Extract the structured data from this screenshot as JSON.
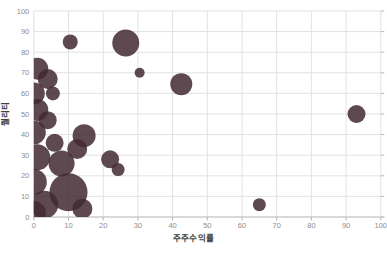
{
  "chart": {
    "x_axis": {
      "title": "주주수익률",
      "ticks": [
        0,
        10,
        20,
        30,
        40,
        50,
        60,
        70,
        80,
        90,
        100
      ],
      "range": [
        0,
        100
      ]
    },
    "y_axis": {
      "title": "퀄리티",
      "ticks": [
        0,
        10,
        20,
        30,
        40,
        50,
        60,
        70,
        80,
        90,
        100
      ],
      "range": [
        0,
        100
      ]
    },
    "colors": {
      "bubble": "rgba(66,41,49,0.85)",
      "grid": "#e2e2e2",
      "axis_line": "#c0c0c0",
      "tick_mark": "#b5b5b5",
      "tick_label": "#8e8e8e",
      "axis_title": "#3f3f3f",
      "background": "#ffffff"
    }
  },
  "chart_data": {
    "type": "scatter",
    "subtype": "bubble",
    "title": "",
    "xlabel": "주주수익률",
    "ylabel": "퀄리티",
    "xlim": [
      0,
      100
    ],
    "ylim": [
      0,
      100
    ],
    "grid": true,
    "legend": false,
    "points": [
      {
        "x": 1,
        "y": 72,
        "r": 11
      },
      {
        "x": 4,
        "y": 67,
        "r": 10
      },
      {
        "x": 0,
        "y": 60,
        "r": 11
      },
      {
        "x": 5.5,
        "y": 60,
        "r": 7
      },
      {
        "x": 1,
        "y": 52,
        "r": 11
      },
      {
        "x": 4,
        "y": 47,
        "r": 9
      },
      {
        "x": 0,
        "y": 41,
        "r": 12
      },
      {
        "x": 6,
        "y": 36,
        "r": 9
      },
      {
        "x": 1,
        "y": 29,
        "r": 13
      },
      {
        "x": 8,
        "y": 26,
        "r": 13
      },
      {
        "x": 0,
        "y": 17,
        "r": 13
      },
      {
        "x": 10,
        "y": 12,
        "r": 19
      },
      {
        "x": 3,
        "y": 6,
        "r": 14
      },
      {
        "x": 14,
        "y": 4,
        "r": 10
      },
      {
        "x": 0,
        "y": 2,
        "r": 12
      },
      {
        "x": 12.5,
        "y": 33,
        "r": 10
      },
      {
        "x": 14.5,
        "y": 39.5,
        "r": 11.5
      },
      {
        "x": 22,
        "y": 28,
        "r": 9
      },
      {
        "x": 24.3,
        "y": 23,
        "r": 6.5
      },
      {
        "x": 10.5,
        "y": 85,
        "r": 7.5
      },
      {
        "x": 26.5,
        "y": 84.5,
        "r": 13.5
      },
      {
        "x": 30.5,
        "y": 70,
        "r": 5
      },
      {
        "x": 42.5,
        "y": 64.5,
        "r": 11
      },
      {
        "x": 93,
        "y": 50,
        "r": 9
      },
      {
        "x": 65,
        "y": 6,
        "r": 6.5
      }
    ]
  }
}
